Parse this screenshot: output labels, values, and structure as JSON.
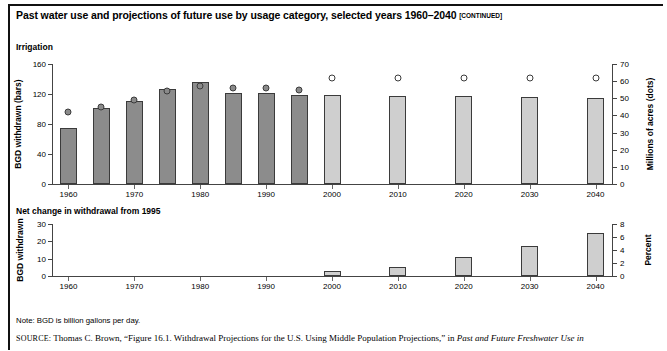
{
  "title": {
    "text": "Past water use and projections of future use by usage category, selected years 1960–2040",
    "continued": "[CONTINUED]"
  },
  "note": "Note: BGD is billion gallons per day.",
  "source": {
    "label": "SOURCE:",
    "text_before_italic": " Thomas C. Brown, “Figure 16.1. Withdrawal Projections for the U.S. Using Middle Population Projections,” in ",
    "italic_text": "Past and Future Freshwater Use in"
  },
  "colors": {
    "historical_bar": "#8c8c8c",
    "projection_bar": "#cfcfcf",
    "bar_outline": "#3b3b3b",
    "axis": "#444444"
  },
  "chart_data": [
    {
      "type": "bar",
      "title": "Irrigation",
      "xlabel": "",
      "ylabel": "BGD withdrawn (bars)",
      "y2label": "Millions of acres (dots)",
      "ylim": [
        0,
        160
      ],
      "yticks": [
        0,
        40,
        80,
        120,
        160
      ],
      "y2lim": [
        0,
        70
      ],
      "y2ticks": [
        0,
        10,
        20,
        30,
        40,
        50,
        60,
        70
      ],
      "xlim": [
        1957.5,
        2042.5
      ],
      "xticks": [
        1960,
        1970,
        1980,
        1990,
        2000,
        2010,
        2020,
        2030,
        2040
      ],
      "grid": false,
      "legend": "",
      "series": [
        {
          "name": "BGD withdrawn (bars)",
          "x": [
            1960,
            1965,
            1970,
            1975,
            1980,
            1985,
            1990,
            1995,
            2000,
            2010,
            2020,
            2030,
            2040
          ],
          "values": [
            75,
            102,
            111,
            127,
            136,
            121,
            121,
            119,
            119,
            118,
            118,
            116,
            115
          ],
          "kinds": [
            "hist",
            "hist",
            "hist",
            "hist",
            "hist",
            "hist",
            "hist",
            "hist",
            "proj",
            "proj",
            "proj",
            "proj",
            "proj"
          ]
        },
        {
          "name": "Millions of acres (dots)",
          "x": [
            1960,
            1965,
            1970,
            1975,
            1980,
            1985,
            1990,
            1995,
            2000,
            2010,
            2020,
            2030,
            2040
          ],
          "values": [
            42,
            45,
            49,
            54,
            57,
            56,
            56,
            55,
            62,
            62,
            62,
            62,
            62
          ],
          "kinds": [
            "filled",
            "filled",
            "filled",
            "filled",
            "filled",
            "filled",
            "filled",
            "filled",
            "open",
            "open",
            "open",
            "open",
            "open"
          ]
        }
      ]
    },
    {
      "type": "bar",
      "title": "Net change in withdrawal from 1995",
      "xlabel": "",
      "ylabel": "BGD withdrawn",
      "y2label": "Percent",
      "ylim": [
        0,
        30
      ],
      "yticks": [
        0,
        10,
        20,
        30
      ],
      "y2lim": [
        0,
        8
      ],
      "y2ticks": [
        0,
        2,
        4,
        6,
        8
      ],
      "xlim": [
        1957.5,
        2042.5
      ],
      "xticks": [
        1960,
        1970,
        1980,
        1990,
        2000,
        2010,
        2020,
        2030,
        2040
      ],
      "grid": false,
      "legend": "",
      "series": [
        {
          "name": "BGD withdrawn",
          "x": [
            2000,
            2010,
            2020,
            2030,
            2040
          ],
          "values": [
            2.8,
            5.2,
            11.0,
            17.5,
            25.0
          ],
          "kinds": [
            "proj",
            "proj",
            "proj",
            "proj",
            "proj"
          ]
        }
      ]
    }
  ]
}
